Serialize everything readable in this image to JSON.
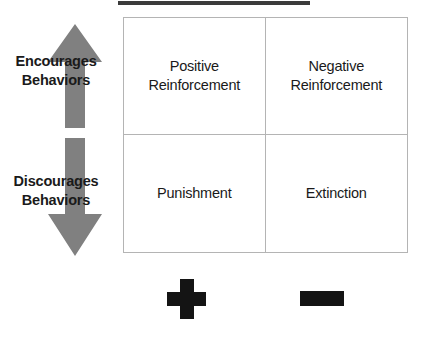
{
  "diagram": {
    "title": "Operant Conditioning",
    "axis_labels": [
      {
        "id": "encourages",
        "line1": "Encourages",
        "line2": "Behaviors"
      },
      {
        "id": "discourages",
        "line1": "Discourages",
        "line2": "Behaviors"
      }
    ],
    "arrows": [
      {
        "name": "up-arrow",
        "direction": "up",
        "color": "#808080"
      },
      {
        "name": "down-arrow",
        "direction": "down",
        "color": "#808080"
      }
    ],
    "quadrants": [
      {
        "id": "positive-reinforcement",
        "line1": "Positive",
        "line2": "Reinforcement"
      },
      {
        "id": "negative-reinforcement",
        "line1": "Negative",
        "line2": "Reinforcement"
      },
      {
        "id": "punishment",
        "line1": "Punishment",
        "line2": ""
      },
      {
        "id": "extinction",
        "line1": "Extinction",
        "line2": ""
      }
    ],
    "column_symbols": [
      {
        "id": "plus",
        "glyph": "+",
        "label": "plus-sign",
        "color": "#141414"
      },
      {
        "id": "minus",
        "glyph": "–",
        "label": "minus-sign",
        "color": "#141414"
      }
    ],
    "colors": {
      "arrow_gray": "#808080",
      "grid_border": "#b4b4b4",
      "text": "#1a1a1a",
      "symbol": "#141414",
      "title_rule": "#3b3b3b",
      "background": "#ffffff"
    }
  }
}
